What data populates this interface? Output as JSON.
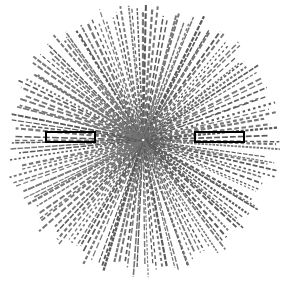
{
  "figure": {
    "type": "radial-line-diagram",
    "background_color": "#ffffff",
    "line_color": "#767676",
    "line_color_dark": "#5a5a5a",
    "annotation_color": "#000000"
  },
  "field": {
    "shape": "circle",
    "center_x": 143,
    "center_y": 140,
    "radius_x": 139,
    "radius_y": 138,
    "ray_count": 156,
    "ray_min_length_fraction": 0.17,
    "dash_on_min": 2,
    "dash_on_max": 7,
    "dash_off_min": 1,
    "dash_off_max": 3,
    "stroke_width_min": 1.1,
    "stroke_width_max": 2.3,
    "angle_jitter_deg": 1.1,
    "random_seed": 20240917
  },
  "annotations": [
    {
      "name": "left-annotation-box",
      "label": "",
      "x": 45,
      "y": 131,
      "width": 51,
      "height": 12,
      "stroke": "#000000",
      "stroke_width": 2
    },
    {
      "name": "right-annotation-box",
      "label": "",
      "x": 194,
      "y": 131,
      "width": 51,
      "height": 12,
      "stroke": "#000000",
      "stroke_width": 2
    }
  ],
  "chart_data": {
    "type": "scatter",
    "xlabel": "",
    "ylabel": "",
    "series": [
      {
        "name": "rays",
        "count": 156,
        "origin": [
          143,
          140
        ],
        "outer_boundary": "ellipse r=(139,138)"
      }
    ],
    "legend": []
  }
}
